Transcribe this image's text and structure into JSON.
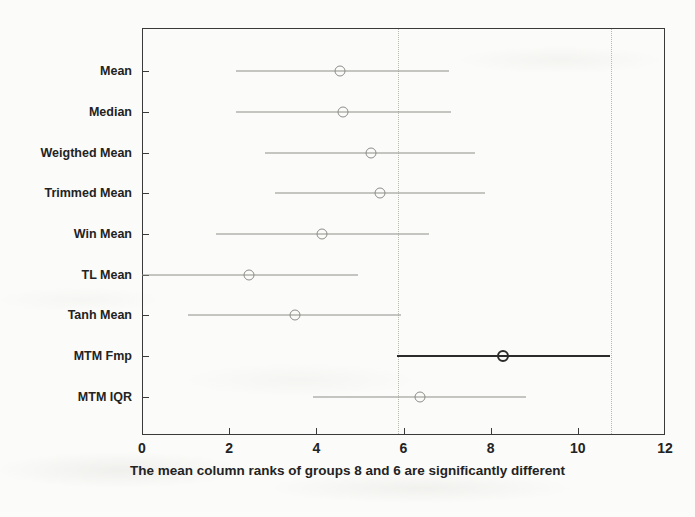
{
  "chart_data": {
    "type": "scatter",
    "title": "",
    "subtitle": "",
    "xlabel": "The mean column ranks of groups 8 and 6 are significantly different",
    "ylabel": "",
    "xlim": [
      0,
      12
    ],
    "xticks": [
      "0",
      "2",
      "4",
      "6",
      "8",
      "10",
      "12"
    ],
    "xtick_values": [
      0,
      2,
      4,
      6,
      8,
      10,
      12
    ],
    "grid": false,
    "legend": "none",
    "categories": [
      "Mean",
      "Median",
      "Weigthed Mean",
      "Trimmed Mean",
      "Win Mean",
      "TL Mean",
      "Tanh Mean",
      "MTM Fmp",
      "MTM IQR"
    ],
    "reference_lines": [
      5.85,
      10.73
    ],
    "series": [
      {
        "name": "mean column rank with comparison interval",
        "points": [
          {
            "category": "Mean",
            "center": 4.55,
            "low": 2.15,
            "high": 7.05,
            "highlight": false
          },
          {
            "category": "Median",
            "center": 4.62,
            "low": 2.15,
            "high": 7.1,
            "highlight": false
          },
          {
            "category": "Weigthed Mean",
            "center": 5.25,
            "low": 2.82,
            "high": 7.65,
            "highlight": false
          },
          {
            "category": "Trimmed Mean",
            "center": 5.47,
            "low": 3.05,
            "high": 7.88,
            "highlight": false
          },
          {
            "category": "Win Mean",
            "center": 4.12,
            "low": 1.7,
            "high": 6.58,
            "highlight": false
          },
          {
            "category": "TL Mean",
            "center": 2.45,
            "low": 0.0,
            "high": 4.95,
            "highlight": false
          },
          {
            "category": "Tanh Mean",
            "center": 3.52,
            "low": 1.05,
            "high": 5.95,
            "highlight": false
          },
          {
            "category": "MTM Fmp",
            "center": 8.28,
            "low": 5.85,
            "high": 10.73,
            "highlight": true
          },
          {
            "category": "MTM IQR",
            "center": 6.38,
            "low": 3.92,
            "high": 8.82,
            "highlight": false
          }
        ]
      }
    ],
    "colors": {
      "axis": "#3a3a3a",
      "interval": "#8d8d88",
      "highlight": "#2b2b2b",
      "reference": "#b9b9b4",
      "background": "#fbfbf9",
      "text": "#232323"
    }
  }
}
